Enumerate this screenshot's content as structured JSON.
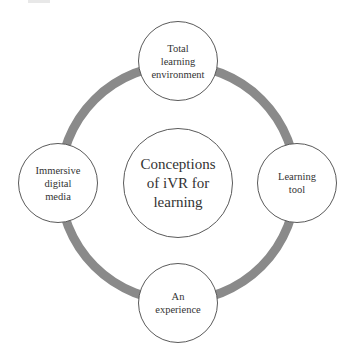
{
  "diagram": {
    "ring_color": "#8a8a8a",
    "center": {
      "label": "Conceptions\nof iVR for\nlearning"
    },
    "nodes": [
      {
        "id": "top",
        "label": "Total\nlearning\nenvironment"
      },
      {
        "id": "right",
        "label": "Learning\ntool"
      },
      {
        "id": "bottom",
        "label": "An\nexperience"
      },
      {
        "id": "left",
        "label": "Immersive\ndigital\nmedia"
      }
    ]
  }
}
